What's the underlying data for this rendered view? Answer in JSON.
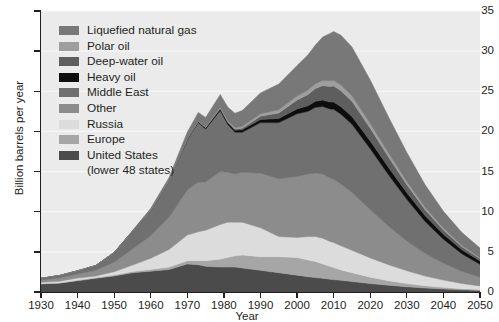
{
  "chart_data": {
    "type": "area",
    "title": "",
    "xlabel": "Year",
    "ylabel": "Billion barrels per year",
    "xlim": [
      1930,
      2050
    ],
    "ylim": [
      0,
      35
    ],
    "xticks": [
      1930,
      1940,
      1950,
      1960,
      1970,
      1980,
      1990,
      2000,
      2010,
      2020,
      2030,
      2040,
      2050
    ],
    "yticks": [
      0,
      5,
      10,
      15,
      20,
      25,
      30,
      35
    ],
    "grid": "horizontal-light",
    "legend_position": "upper-left-inside",
    "stacked": true,
    "plot_background": "#ebebeb",
    "x": [
      1930,
      1935,
      1940,
      1945,
      1950,
      1955,
      1960,
      1965,
      1970,
      1973,
      1975,
      1979,
      1981,
      1983,
      1985,
      1990,
      1995,
      2000,
      2003,
      2005,
      2007,
      2009,
      2010,
      2012,
      2015,
      2020,
      2025,
      2030,
      2035,
      2040,
      2045,
      2050
    ],
    "series": [
      {
        "name": "United  States",
        "sublabel": "(lower 48 states)",
        "color": "#4b4b4b",
        "legend_swatch": "#4b4b4b",
        "values": [
          1.0,
          1.1,
          1.4,
          1.7,
          2.0,
          2.4,
          2.6,
          2.8,
          3.5,
          3.4,
          3.2,
          3.1,
          3.1,
          3.1,
          3.0,
          2.7,
          2.4,
          2.1,
          1.9,
          1.8,
          1.7,
          1.6,
          1.55,
          1.45,
          1.3,
          1.05,
          0.85,
          0.65,
          0.5,
          0.38,
          0.28,
          0.2
        ]
      },
      {
        "name": "Europe",
        "color": "#a6a6a6",
        "legend_swatch": "#a6a6a6",
        "values": [
          0.05,
          0.05,
          0.08,
          0.1,
          0.12,
          0.15,
          0.2,
          0.3,
          0.4,
          0.5,
          0.7,
          1.0,
          1.2,
          1.4,
          1.6,
          1.7,
          2.0,
          2.2,
          2.1,
          2.0,
          1.8,
          1.6,
          1.5,
          1.3,
          1.1,
          0.8,
          0.55,
          0.4,
          0.28,
          0.2,
          0.14,
          0.1
        ]
      },
      {
        "name": "Russia",
        "color": "#dcdcdc",
        "legend_swatch": "#dcdcdc",
        "values": [
          0.15,
          0.2,
          0.25,
          0.2,
          0.4,
          0.8,
          1.4,
          2.2,
          3.2,
          3.6,
          3.8,
          4.3,
          4.4,
          4.2,
          4.1,
          3.6,
          2.5,
          2.5,
          2.9,
          3.1,
          3.2,
          3.1,
          3.1,
          3.0,
          2.8,
          2.4,
          2.0,
          1.6,
          1.2,
          0.9,
          0.65,
          0.45
        ]
      },
      {
        "name": "Other",
        "color": "#8c8c8c",
        "legend_swatch": "#8c8c8c",
        "values": [
          0.3,
          0.4,
          0.5,
          0.7,
          1.2,
          2.0,
          2.8,
          4.0,
          5.6,
          6.2,
          6.0,
          6.6,
          6.2,
          6.0,
          6.2,
          6.8,
          7.2,
          7.6,
          7.8,
          7.9,
          8.0,
          7.9,
          7.9,
          7.7,
          7.2,
          6.0,
          4.8,
          3.7,
          2.8,
          2.1,
          1.5,
          1.1
        ]
      },
      {
        "name": "Middle East",
        "color": "#707070",
        "legend_swatch": "#707070",
        "values": [
          0.2,
          0.3,
          0.4,
          0.6,
          1.2,
          2.2,
          3.2,
          4.5,
          6.3,
          7.4,
          6.6,
          7.6,
          6.0,
          5.2,
          5.0,
          6.3,
          7.0,
          7.8,
          7.8,
          8.2,
          8.4,
          8.6,
          8.7,
          8.7,
          8.5,
          7.6,
          6.4,
          5.2,
          4.0,
          3.0,
          2.2,
          1.6
        ]
      },
      {
        "name": "Heavy oil",
        "color": "#0d0d0d",
        "legend_swatch": "#0d0d0d",
        "values": [
          0.0,
          0.0,
          0.0,
          0.0,
          0.0,
          0.0,
          0.02,
          0.05,
          0.1,
          0.12,
          0.15,
          0.2,
          0.22,
          0.25,
          0.3,
          0.4,
          0.5,
          0.6,
          0.7,
          0.75,
          0.8,
          0.85,
          0.9,
          0.92,
          0.95,
          0.95,
          0.9,
          0.82,
          0.72,
          0.6,
          0.5,
          0.4
        ]
      },
      {
        "name": "Deep-water oil",
        "color": "#5e5e5e",
        "legend_swatch": "#5e5e5e",
        "values": [
          0.0,
          0.0,
          0.0,
          0.0,
          0.0,
          0.0,
          0.0,
          0.0,
          0.02,
          0.03,
          0.05,
          0.1,
          0.12,
          0.15,
          0.2,
          0.4,
          0.7,
          1.1,
          1.4,
          1.6,
          1.8,
          1.95,
          2.0,
          2.0,
          1.9,
          1.6,
          1.3,
          1.0,
          0.75,
          0.55,
          0.4,
          0.3
        ]
      },
      {
        "name": "Polar oil",
        "color": "#9e9e9e",
        "legend_swatch": "#9e9e9e",
        "values": [
          0.0,
          0.0,
          0.0,
          0.0,
          0.0,
          0.0,
          0.0,
          0.0,
          0.0,
          0.02,
          0.04,
          0.1,
          0.12,
          0.15,
          0.2,
          0.3,
          0.4,
          0.5,
          0.55,
          0.6,
          0.65,
          0.7,
          0.7,
          0.7,
          0.68,
          0.6,
          0.5,
          0.4,
          0.3,
          0.22,
          0.16,
          0.12
        ]
      },
      {
        "name": "Liquefied natural gas",
        "color": "#787878",
        "legend_swatch": "#787878",
        "values": [
          0.0,
          0.0,
          0.0,
          0.0,
          0.0,
          0.1,
          0.2,
          0.4,
          0.8,
          1.1,
          1.2,
          1.6,
          1.7,
          1.8,
          2.0,
          2.6,
          3.2,
          3.8,
          4.4,
          4.8,
          5.4,
          5.9,
          6.1,
          6.2,
          6.1,
          5.4,
          4.5,
          3.6,
          2.8,
          2.1,
          1.6,
          1.2
        ]
      }
    ],
    "heavy_oil_outline": "#000000"
  },
  "legend": {
    "items": [
      {
        "label": "Liquefied natural gas",
        "color": "#787878"
      },
      {
        "label": "Polar oil",
        "color": "#9e9e9e"
      },
      {
        "label": "Deep-water oil",
        "color": "#5e5e5e"
      },
      {
        "label": "Heavy oil",
        "color": "#0d0d0d"
      },
      {
        "label": "Middle East",
        "color": "#707070"
      },
      {
        "label": "Other",
        "color": "#8c8c8c"
      },
      {
        "label": "Russia",
        "color": "#dcdcdc"
      },
      {
        "label": "Europe",
        "color": "#a6a6a6"
      },
      {
        "label": "United  States",
        "sublabel": "(lower 48 states)",
        "color": "#4b4b4b"
      }
    ]
  },
  "axes": {
    "y_title": "Billion barrels per year",
    "x_title": "Year",
    "y_labels": [
      "0",
      "5",
      "10",
      "15",
      "20",
      "25",
      "30",
      "35"
    ],
    "x_labels": [
      "1930",
      "1940",
      "1950",
      "1960",
      "1970",
      "1980",
      "1990",
      "2000",
      "2010",
      "2020",
      "2030",
      "2040",
      "2050"
    ]
  }
}
